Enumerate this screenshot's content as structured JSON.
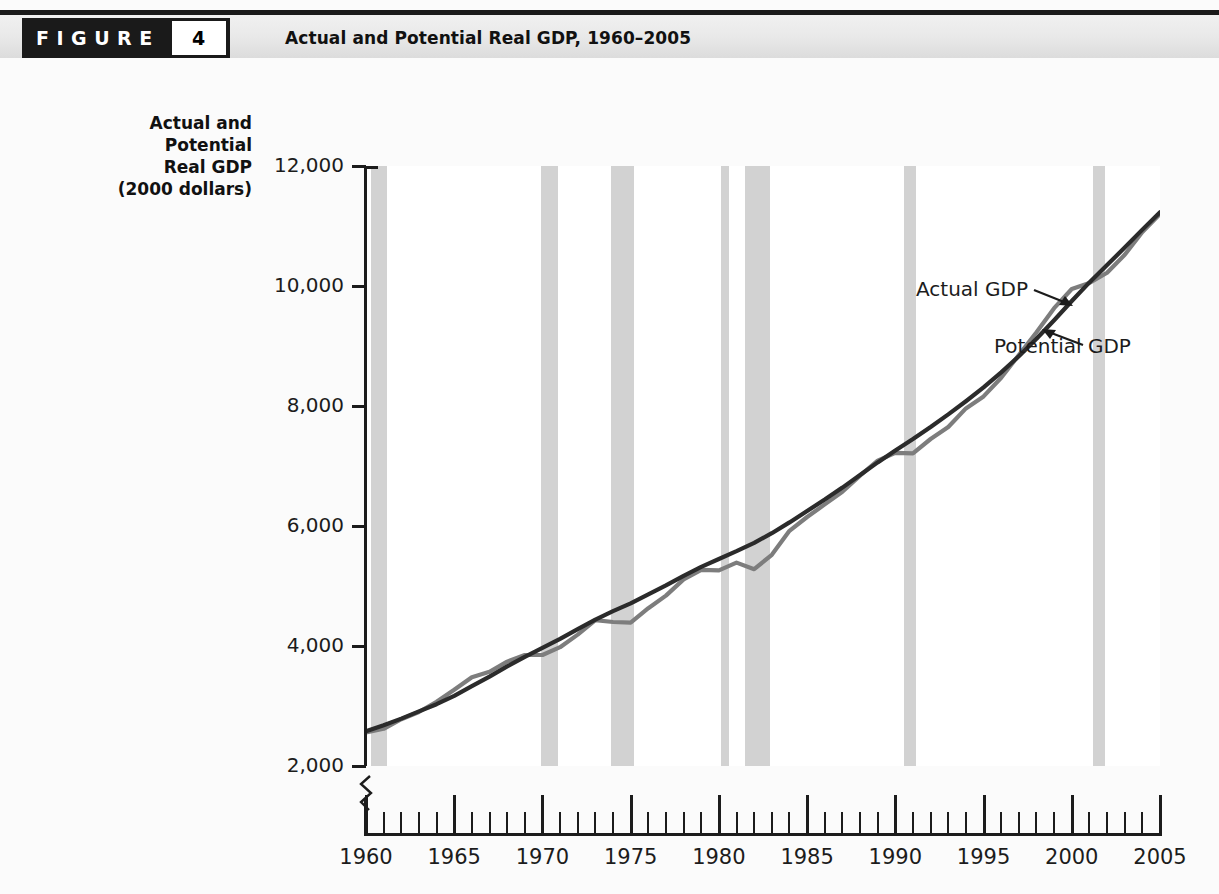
{
  "figure": {
    "word": "FIGURE",
    "number": "4",
    "title": "Actual and Potential Real GDP, 1960–2005"
  },
  "chart_data": {
    "type": "line",
    "title": "Actual and Potential Real GDP, 1960–2005",
    "ylabel": "Actual and\nPotential\nReal GDP\n(2000 dollars)",
    "ylabel_lines": [
      "Actual and",
      "Potential",
      "Real GDP",
      "(2000 dollars)"
    ],
    "xlabel": "",
    "ylim": [
      2000,
      12000
    ],
    "xlim": [
      1960,
      2005
    ],
    "y_ticks": [
      2000,
      4000,
      6000,
      8000,
      10000,
      12000
    ],
    "y_tick_labels": [
      "2,000",
      "4,000",
      "6,000",
      "8,000",
      "10,000",
      "12,000"
    ],
    "x_ticks": [
      1960,
      1965,
      1970,
      1975,
      1980,
      1985,
      1990,
      1995,
      2000,
      2005
    ],
    "x_tick_labels": [
      "1960",
      "1965",
      "1970",
      "1975",
      "1980",
      "1985",
      "1990",
      "1995",
      "2000",
      "2005"
    ],
    "x_minor_tick_interval": 1,
    "y_axis_break": true,
    "grid": false,
    "legend_position": "inline-annotations",
    "annotations": [
      {
        "label": "Actual GDP",
        "points_to": "actual-gdp-line",
        "arrow": "down-right"
      },
      {
        "label": "Potential GDP",
        "points_to": "potential-gdp-line",
        "arrow": "up-left"
      }
    ],
    "colors": {
      "actual": "#7d7d7d",
      "potential": "#2b2b2b",
      "recession_band": "#d2d2d2",
      "plot_background": "#ffffff",
      "axis": "#1c1c1c",
      "page_background": "#fbfbfb",
      "header_bar": "#1a1a1a"
    },
    "recession_bands": [
      {
        "start": 1960.3,
        "end": 1961.2
      },
      {
        "start": 1969.9,
        "end": 1970.9
      },
      {
        "start": 1973.9,
        "end": 1975.2
      },
      {
        "start": 1980.1,
        "end": 1980.6
      },
      {
        "start": 1981.5,
        "end": 1982.9
      },
      {
        "start": 1990.5,
        "end": 1991.2
      },
      {
        "start": 2001.2,
        "end": 2001.9
      }
    ],
    "x": [
      1960,
      1961,
      1962,
      1963,
      1964,
      1965,
      1966,
      1967,
      1968,
      1969,
      1970,
      1971,
      1972,
      1973,
      1974,
      1975,
      1976,
      1977,
      1978,
      1979,
      1980,
      1981,
      1982,
      1983,
      1984,
      1985,
      1986,
      1987,
      1988,
      1989,
      1990,
      1991,
      1992,
      1993,
      1994,
      1995,
      1996,
      1997,
      1998,
      1999,
      2000,
      2001,
      2002,
      2003,
      2004,
      2005
    ],
    "series": [
      {
        "name": "Actual GDP",
        "color": "#7d7d7d",
        "values": [
          2560,
          2620,
          2780,
          2900,
          3070,
          3270,
          3480,
          3570,
          3740,
          3850,
          3850,
          3980,
          4190,
          4430,
          4400,
          4390,
          4630,
          4840,
          5110,
          5270,
          5260,
          5390,
          5280,
          5520,
          5920,
          6150,
          6360,
          6570,
          6840,
          7090,
          7220,
          7210,
          7450,
          7650,
          7960,
          8160,
          8470,
          8850,
          9230,
          9630,
          9950,
          10050,
          10220,
          10520,
          10900,
          11200
        ]
      },
      {
        "name": "Potential GDP",
        "color": "#2b2b2b",
        "values": [
          2580,
          2680,
          2790,
          2910,
          3030,
          3170,
          3330,
          3490,
          3660,
          3820,
          3970,
          4120,
          4280,
          4440,
          4580,
          4710,
          4860,
          5010,
          5170,
          5320,
          5450,
          5580,
          5720,
          5880,
          6060,
          6250,
          6440,
          6640,
          6850,
          7060,
          7260,
          7450,
          7650,
          7860,
          8080,
          8310,
          8560,
          8830,
          9120,
          9430,
          9750,
          10060,
          10350,
          10640,
          10940,
          11230
        ]
      }
    ]
  }
}
